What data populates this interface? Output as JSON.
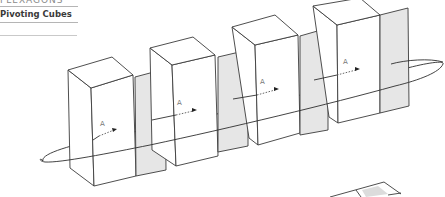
{
  "header": {
    "section_label": "FLEXAGONS",
    "title": "Pivoting Cubes"
  },
  "diagram": {
    "cube_count": 4,
    "arrow_label": "A",
    "arrow_labels": [
      "A",
      "A",
      "A",
      "A"
    ],
    "colors": {
      "line": "#3b3b3b",
      "panel_fill": "#e6e6e6",
      "background": "#ffffff"
    }
  }
}
